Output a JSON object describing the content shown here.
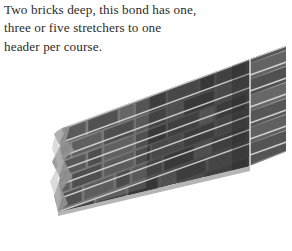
{
  "page": {
    "width": 292,
    "height": 251,
    "background_color": "#ffffff"
  },
  "caption": {
    "full_text": "Two bricks deep, this bond has one, three or five stretchers to one header per course.",
    "text_color": "#2b2b2b",
    "lines": [
      "Two bricks deep, this bond has one,",
      "three or five stretchers to one",
      "header per course."
    ]
  },
  "illustration": {
    "name": "brick-wall-perspective-illustration",
    "subject": "brick wall",
    "style": "grayscale photographic cutout",
    "description": "A grayscale brick wall shown in three-quarter perspective. The long stretcher face recedes toward the upper left, a short header return face is visible at the right end. The left end of the wall fades out in a soft ragged torn edge.",
    "colors": {
      "brick_dark": "#3a3a3a",
      "brick_mid": "#555555",
      "brick_light": "#7b7b7b",
      "mortar": "#c9c9c9",
      "mortar_highlight": "#e6e6e6",
      "top_surface": "#909090",
      "shadow": "#262626",
      "background": "#ffffff"
    },
    "geometry": {
      "top_edge_left_x": 62,
      "top_edge_left_y": 128,
      "top_edge_right_x": 286,
      "top_edge_right_y": 46,
      "bottom_edge_left_x": 58,
      "bottom_edge_left_y": 212,
      "bottom_edge_right_x": 286,
      "bottom_edge_right_y": 152,
      "return_face_left_x": 250,
      "return_face_right_x": 286,
      "course_count": 7,
      "courses_visible": 7
    },
    "bond": {
      "name": "bond pattern",
      "depth_label": "Two bricks deep",
      "stretchers_per_header": "one, three or five",
      "headers_per_course": 1
    }
  }
}
